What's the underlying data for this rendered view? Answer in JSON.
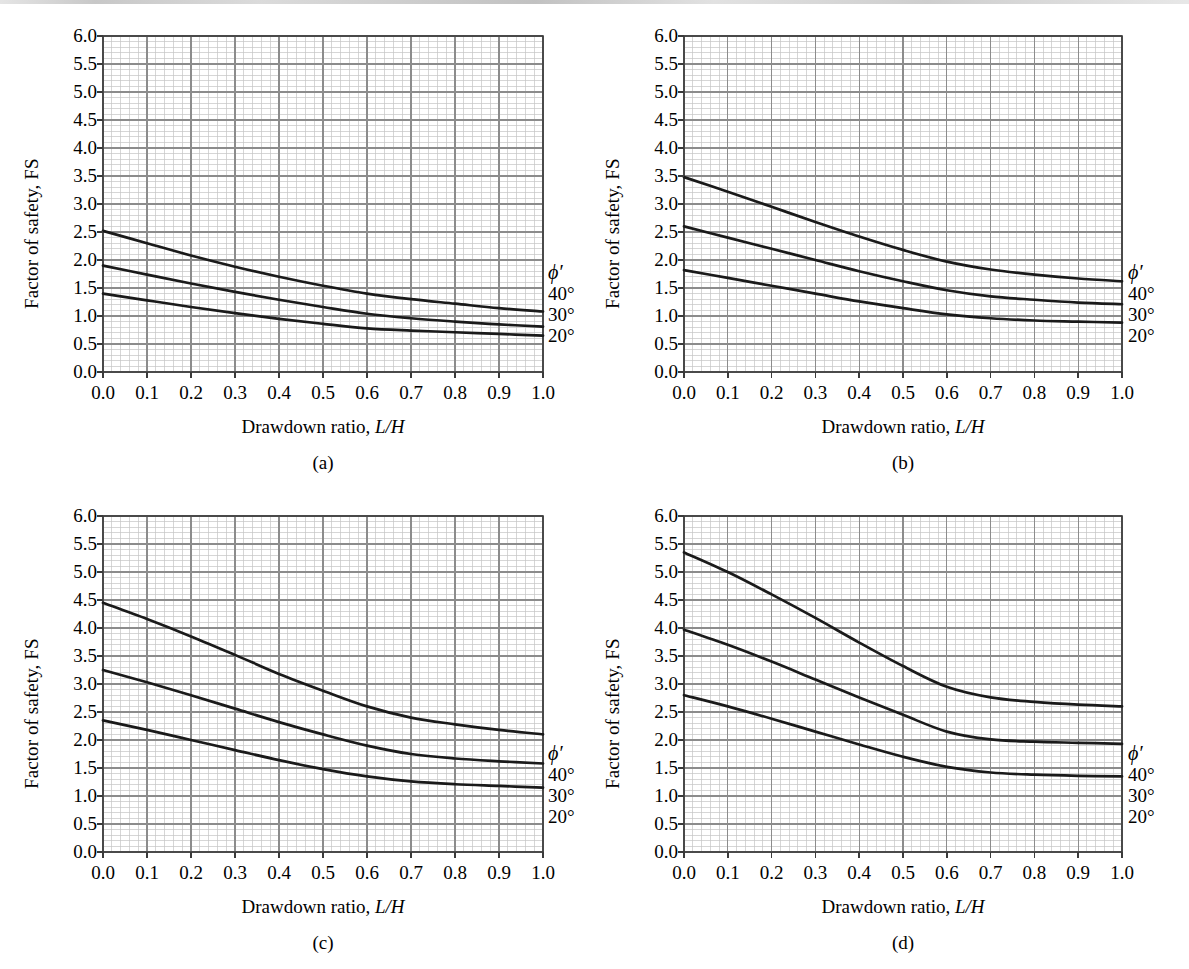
{
  "figure": {
    "background": "#ffffff",
    "curve_color": "#1a1a1a",
    "grid_major_color": "#8c8c8c",
    "grid_minor_color": "#c4c4c4",
    "frame_color": "#3a3a3a"
  },
  "axis": {
    "xlabel_prefix": "Drawdown ratio, ",
    "xlabel_italic": "L/H",
    "ylabel": "Factor of safety, FS",
    "xticks": [
      "0.0",
      "0.1",
      "0.2",
      "0.3",
      "0.4",
      "0.5",
      "0.6",
      "0.7",
      "0.8",
      "0.9",
      "1.0"
    ],
    "yticks": [
      "0.0",
      "0.5",
      "1.0",
      "1.5",
      "2.0",
      "2.5",
      "3.0",
      "3.5",
      "4.0",
      "4.5",
      "5.0",
      "5.5",
      "6.0"
    ]
  },
  "legend": {
    "title": "ϕ′",
    "entries": [
      "40°",
      "30°",
      "20°"
    ]
  },
  "panels": [
    {
      "key": "a",
      "caption": "(a)"
    },
    {
      "key": "b",
      "caption": "(b)"
    },
    {
      "key": "c",
      "caption": "(c)"
    },
    {
      "key": "d",
      "caption": "(d)"
    }
  ],
  "chart_data": [
    {
      "type": "line",
      "panel": "(a)",
      "title": "",
      "xlabel": "Drawdown ratio, L/H",
      "ylabel": "Factor of safety, FS",
      "xlim": [
        0.0,
        1.0
      ],
      "ylim": [
        0.0,
        6.0
      ],
      "grid": true,
      "legend_position": "right-outside",
      "x": [
        0.0,
        0.1,
        0.2,
        0.3,
        0.4,
        0.5,
        0.6,
        0.7,
        0.8,
        0.9,
        1.0
      ],
      "series": [
        {
          "name": "40°",
          "values": [
            2.52,
            2.3,
            2.08,
            1.88,
            1.7,
            1.54,
            1.4,
            1.3,
            1.22,
            1.14,
            1.08
          ]
        },
        {
          "name": "30°",
          "values": [
            1.9,
            1.74,
            1.58,
            1.43,
            1.29,
            1.16,
            1.04,
            0.96,
            0.9,
            0.85,
            0.81
          ]
        },
        {
          "name": "20°",
          "values": [
            1.4,
            1.28,
            1.16,
            1.05,
            0.95,
            0.86,
            0.78,
            0.74,
            0.71,
            0.68,
            0.65
          ]
        }
      ]
    },
    {
      "type": "line",
      "panel": "(b)",
      "title": "",
      "xlabel": "Drawdown ratio, L/H",
      "ylabel": "Factor of safety, FS",
      "xlim": [
        0.0,
        1.0
      ],
      "ylim": [
        0.0,
        6.0
      ],
      "grid": true,
      "legend_position": "right-outside",
      "x": [
        0.0,
        0.1,
        0.2,
        0.3,
        0.4,
        0.5,
        0.6,
        0.7,
        0.8,
        0.9,
        1.0
      ],
      "series": [
        {
          "name": "40°",
          "values": [
            3.48,
            3.22,
            2.95,
            2.68,
            2.42,
            2.18,
            1.97,
            1.83,
            1.74,
            1.67,
            1.62
          ]
        },
        {
          "name": "30°",
          "values": [
            2.6,
            2.4,
            2.2,
            2.0,
            1.8,
            1.62,
            1.46,
            1.35,
            1.29,
            1.24,
            1.21
          ]
        },
        {
          "name": "20°",
          "values": [
            1.82,
            1.68,
            1.54,
            1.4,
            1.26,
            1.14,
            1.03,
            0.96,
            0.92,
            0.9,
            0.88
          ]
        }
      ]
    },
    {
      "type": "line",
      "panel": "(c)",
      "title": "",
      "xlabel": "Drawdown ratio, L/H",
      "ylabel": "Factor of safety, FS",
      "xlim": [
        0.0,
        1.0
      ],
      "ylim": [
        0.0,
        6.0
      ],
      "grid": true,
      "legend_position": "right-outside",
      "x": [
        0.0,
        0.1,
        0.2,
        0.3,
        0.4,
        0.5,
        0.6,
        0.7,
        0.8,
        0.9,
        1.0
      ],
      "series": [
        {
          "name": "40°",
          "values": [
            4.45,
            4.16,
            3.85,
            3.52,
            3.18,
            2.88,
            2.6,
            2.4,
            2.28,
            2.18,
            2.1
          ]
        },
        {
          "name": "30°",
          "values": [
            3.25,
            3.03,
            2.8,
            2.56,
            2.32,
            2.1,
            1.9,
            1.75,
            1.67,
            1.62,
            1.58
          ]
        },
        {
          "name": "20°",
          "values": [
            2.35,
            2.18,
            2.0,
            1.82,
            1.64,
            1.48,
            1.35,
            1.26,
            1.21,
            1.18,
            1.15
          ]
        }
      ]
    },
    {
      "type": "line",
      "panel": "(d)",
      "title": "",
      "xlabel": "Drawdown ratio, L/H",
      "ylabel": "Factor of safety, FS",
      "xlim": [
        0.0,
        1.0
      ],
      "ylim": [
        0.0,
        6.0
      ],
      "grid": true,
      "legend_position": "right-outside",
      "x": [
        0.0,
        0.1,
        0.2,
        0.3,
        0.4,
        0.5,
        0.6,
        0.7,
        0.8,
        0.9,
        1.0
      ],
      "series": [
        {
          "name": "40°",
          "values": [
            5.35,
            5.0,
            4.6,
            4.18,
            3.74,
            3.32,
            2.95,
            2.76,
            2.68,
            2.63,
            2.6
          ]
        },
        {
          "name": "30°",
          "values": [
            3.97,
            3.7,
            3.4,
            3.08,
            2.76,
            2.45,
            2.15,
            2.01,
            1.97,
            1.95,
            1.93
          ]
        },
        {
          "name": "20°",
          "values": [
            2.8,
            2.6,
            2.38,
            2.15,
            1.92,
            1.7,
            1.52,
            1.42,
            1.38,
            1.36,
            1.35
          ]
        }
      ]
    }
  ]
}
